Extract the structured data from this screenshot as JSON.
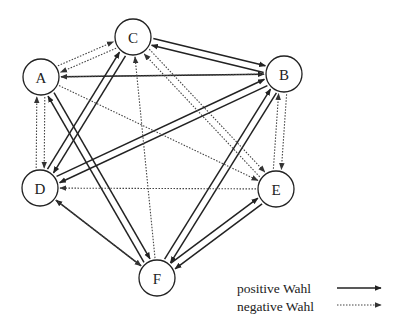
{
  "diagram": {
    "type": "sociogram",
    "nodes": [
      {
        "id": "A",
        "label": "A",
        "x": 41,
        "y": 77
      },
      {
        "id": "B",
        "label": "B",
        "x": 284,
        "y": 74
      },
      {
        "id": "C",
        "label": "C",
        "x": 133,
        "y": 37
      },
      {
        "id": "D",
        "label": "D",
        "x": 40,
        "y": 188
      },
      {
        "id": "E",
        "label": "E",
        "x": 276,
        "y": 189
      },
      {
        "id": "F",
        "label": "F",
        "x": 157,
        "y": 278
      }
    ],
    "node_radius": 18,
    "edges": [
      {
        "from": "A",
        "to": "B",
        "kind": "positive",
        "offset": 0
      },
      {
        "from": "B",
        "to": "A",
        "kind": "negative",
        "offset": 0
      },
      {
        "from": "C",
        "to": "B",
        "kind": "positive",
        "offset": -3.5
      },
      {
        "from": "B",
        "to": "C",
        "kind": "positive",
        "offset": -3.5
      },
      {
        "from": "D",
        "to": "C",
        "kind": "positive",
        "offset": -3.5
      },
      {
        "from": "C",
        "to": "D",
        "kind": "positive",
        "offset": -3.5
      },
      {
        "from": "D",
        "to": "B",
        "kind": "positive",
        "offset": -3.5
      },
      {
        "from": "B",
        "to": "D",
        "kind": "positive",
        "offset": -3.5
      },
      {
        "from": "A",
        "to": "F",
        "kind": "positive",
        "offset": -3.5
      },
      {
        "from": "F",
        "to": "A",
        "kind": "positive",
        "offset": -3.5
      },
      {
        "from": "B",
        "to": "F",
        "kind": "positive",
        "offset": -3.5
      },
      {
        "from": "F",
        "to": "B",
        "kind": "positive",
        "offset": -3.5
      },
      {
        "from": "F",
        "to": "E",
        "kind": "positive",
        "offset": -3.5
      },
      {
        "from": "E",
        "to": "F",
        "kind": "positive",
        "offset": -3.5
      },
      {
        "from": "F",
        "to": "D",
        "kind": "positive",
        "offset": 0
      },
      {
        "from": "A",
        "to": "C",
        "kind": "negative",
        "offset": -3.5
      },
      {
        "from": "C",
        "to": "A",
        "kind": "negative",
        "offset": -3.5
      },
      {
        "from": "A",
        "to": "D",
        "kind": "negative",
        "offset": -4
      },
      {
        "from": "D",
        "to": "A",
        "kind": "negative",
        "offset": -4
      },
      {
        "from": "A",
        "to": "E",
        "kind": "negative",
        "offset": 0
      },
      {
        "from": "C",
        "to": "E",
        "kind": "negative",
        "offset": -3.5
      },
      {
        "from": "E",
        "to": "C",
        "kind": "negative",
        "offset": -3.5
      },
      {
        "from": "F",
        "to": "C",
        "kind": "negative",
        "offset": 0
      },
      {
        "from": "B",
        "to": "E",
        "kind": "negative",
        "offset": -4
      },
      {
        "from": "E",
        "to": "B",
        "kind": "negative",
        "offset": -4
      },
      {
        "from": "E",
        "to": "D",
        "kind": "negative",
        "offset": 0
      },
      {
        "from": "D",
        "to": "F",
        "kind": "negative",
        "offset": 0
      }
    ]
  },
  "legend": {
    "items": [
      {
        "label": "positive Wahl",
        "kind": "positive"
      },
      {
        "label": "negative Wahl",
        "kind": "negative"
      }
    ]
  },
  "colors": {
    "line": "#222222",
    "dotted_line": "#444444",
    "background": "#ffffff"
  }
}
